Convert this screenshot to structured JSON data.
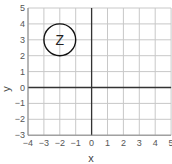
{
  "chart_data": {
    "type": "scatter",
    "title": "",
    "xlabel": "x",
    "ylabel": "y",
    "xlim": [
      -4,
      5
    ],
    "ylim": [
      -3,
      5
    ],
    "grid": true,
    "x_ticks": [
      "-4",
      "-3",
      "-2",
      "-1",
      "0",
      "1",
      "2",
      "3",
      "4",
      "5"
    ],
    "y_ticks": [
      "-3",
      "-2",
      "-1",
      "0",
      "1",
      "2",
      "3",
      "4",
      "5"
    ],
    "shapes": [
      {
        "type": "circle",
        "center": [
          -2,
          3
        ],
        "radius": 1,
        "label": "Z"
      }
    ]
  },
  "colors": {
    "grid": "#c8c8c8",
    "axis": "#333333",
    "circle": "#111111"
  }
}
